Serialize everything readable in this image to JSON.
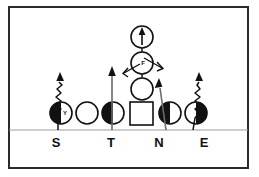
{
  "diagram": {
    "background_color": "#ffffff",
    "frame_color": "#2b2b2b",
    "ink_color": "#111111",
    "line_of_scrimmage_color": "#9a9a9a"
  },
  "defense_labels": [
    {
      "id": "S",
      "label": "S",
      "x": 56,
      "y": 138
    },
    {
      "id": "T",
      "label": "T",
      "x": 103,
      "y": 138
    },
    {
      "id": "N",
      "label": "N",
      "x": 157,
      "y": 138
    },
    {
      "id": "E",
      "label": "E",
      "x": 200,
      "y": 138
    }
  ],
  "defenders": [
    {
      "id": "S",
      "shape": "circle-half",
      "fill_side": "left",
      "inner_label": "Y",
      "cx": 61,
      "cy": 113,
      "r": 11
    },
    {
      "id": "unlabeled-guard",
      "shape": "circle-open",
      "fill_side": "none",
      "inner_label": "",
      "cx": 87,
      "cy": 113,
      "r": 11
    },
    {
      "id": "T",
      "shape": "circle-half",
      "fill_side": "left",
      "inner_label": "",
      "cx": 113,
      "cy": 113,
      "r": 11
    },
    {
      "id": "N",
      "shape": "circle-half",
      "fill_side": "left",
      "inner_label": "",
      "cx": 170,
      "cy": 113,
      "r": 11
    },
    {
      "id": "E",
      "shape": "circle-half",
      "fill_side": "right",
      "inner_label": "",
      "cx": 196,
      "cy": 113,
      "r": 11
    }
  ],
  "offense": [
    {
      "id": "center-box",
      "shape": "square",
      "label": "",
      "x": 130,
      "y": 102,
      "w": 23,
      "h": 23
    },
    {
      "id": "quarterback",
      "shape": "circle-open",
      "label": "",
      "cx": 142,
      "cy": 89,
      "r": 11
    },
    {
      "id": "fullback",
      "shape": "circle-open",
      "label": "F",
      "cx": 142,
      "cy": 63,
      "r": 11
    },
    {
      "id": "tailback",
      "shape": "circle-open",
      "label": "",
      "cx": 142,
      "cy": 37,
      "r": 11
    }
  ],
  "routes": [
    {
      "id": "s-blitz",
      "type": "squiggle-arrow",
      "from": "S",
      "description": "stunt / loop path rising from S"
    },
    {
      "id": "t-rush",
      "type": "straight-arrow",
      "from": "T",
      "description": "straight upfield rush from T"
    },
    {
      "id": "n-rush",
      "type": "straight-arrow",
      "from": "N",
      "description": "straight upfield rush from N"
    },
    {
      "id": "e-blitz",
      "type": "squiggle-arrow",
      "from": "E",
      "description": "stunt / loop path rising from E"
    },
    {
      "id": "tb-run",
      "type": "straight-arrow",
      "from": "tailback",
      "description": "upfield arrow inside tailback circle"
    },
    {
      "id": "fb-option-left",
      "type": "diagonal-arrow",
      "from": "fullback",
      "description": "option path down-left"
    },
    {
      "id": "fb-option-right",
      "type": "diagonal-arrow",
      "from": "fullback",
      "description": "option path down-right"
    }
  ],
  "line_of_scrimmage": {
    "y": 130,
    "x1": 9,
    "x2": 248
  }
}
